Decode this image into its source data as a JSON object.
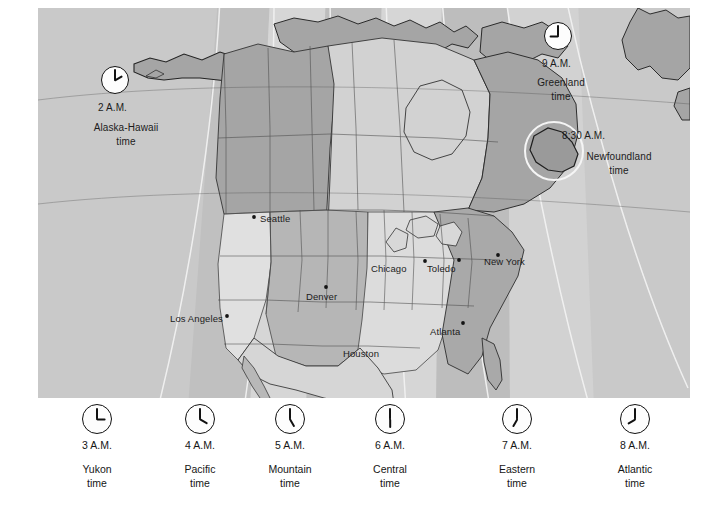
{
  "figure": {
    "background_color": "#ffffff",
    "map_fill_color": "#c9c9c9"
  },
  "map": {
    "callouts": [
      {
        "id": "alaska-hawaii",
        "time": "2 A.M.",
        "name": "Alaska-Hawaii\ntime",
        "clock": {
          "hour_deg": 60,
          "minute_deg": 0
        }
      },
      {
        "id": "greenland",
        "time": "9 A.M.",
        "name": "Greenland\ntime",
        "clock": {
          "hour_deg": 270,
          "minute_deg": 0
        }
      },
      {
        "id": "newfoundland",
        "time": "8:30 A.M.",
        "name": "Newfoundland\ntime",
        "clock": null
      }
    ],
    "cities": [
      {
        "name": "Seattle",
        "x": 222,
        "y": 211
      },
      {
        "name": "Los Angeles",
        "x": 176,
        "y": 311
      },
      {
        "name": "Denver",
        "x": 295,
        "y": 287
      },
      {
        "name": "Chicago",
        "x": 371,
        "y": 258
      },
      {
        "name": "Toledo",
        "x": 430,
        "y": 260
      },
      {
        "name": "New York",
        "x": 484,
        "y": 255
      },
      {
        "name": "Atlanta",
        "x": 425,
        "y": 324
      },
      {
        "name": "Houston",
        "x": 343,
        "y": 347
      }
    ]
  },
  "legend": {
    "items": [
      {
        "time": "3 A.M.",
        "name": "Yukon\ntime",
        "center_x": 97,
        "clock": {
          "hour_deg": 90,
          "minute_deg": 0
        }
      },
      {
        "time": "4 A.M.",
        "name": "Pacific\ntime",
        "center_x": 200,
        "clock": {
          "hour_deg": 120,
          "minute_deg": 0
        }
      },
      {
        "time": "5 A.M.",
        "name": "Mountain\ntime",
        "center_x": 290,
        "clock": {
          "hour_deg": 150,
          "minute_deg": 0
        }
      },
      {
        "time": "6 A.M.",
        "name": "Central\ntime",
        "center_x": 390,
        "clock": {
          "hour_deg": 180,
          "minute_deg": 0
        }
      },
      {
        "time": "7 A.M.",
        "name": "Eastern\ntime",
        "center_x": 517,
        "clock": {
          "hour_deg": 210,
          "minute_deg": 0
        }
      },
      {
        "time": "8 A.M.",
        "name": "Atlantic\ntime",
        "center_x": 635,
        "clock": {
          "hour_deg": 240,
          "minute_deg": 0
        }
      }
    ]
  }
}
